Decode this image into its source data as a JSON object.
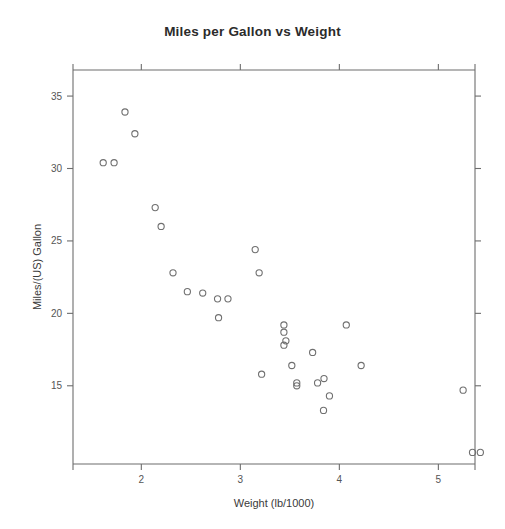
{
  "chart_data": {
    "type": "scatter",
    "title": "Miles per Gallon vs Weight",
    "xlabel": "Weight (lb/1000)",
    "ylabel": "Miles/(US) Gallon",
    "xlim": [
      1.31,
      5.37
    ],
    "ylim": [
      9.6,
      36.8
    ],
    "xticks": [
      2,
      3,
      4,
      5
    ],
    "xtick_labels": [
      "2",
      "3",
      "4",
      "5"
    ],
    "yticks": [
      15,
      20,
      25,
      30,
      35
    ],
    "ytick_labels": [
      "15",
      "20",
      "25",
      "30",
      "35"
    ],
    "grid": false,
    "legend": null,
    "marker": "open-circle",
    "marker_color": "#707070",
    "frame": "box-with-outward-ticks",
    "x": [
      1.615,
      1.725,
      1.835,
      1.935,
      2.14,
      2.2,
      2.32,
      2.465,
      2.62,
      2.77,
      2.78,
      2.875,
      3.15,
      3.19,
      3.215,
      3.44,
      3.44,
      3.44,
      3.46,
      3.52,
      3.57,
      3.57,
      3.73,
      3.78,
      3.84,
      3.845,
      3.9,
      4.07,
      4.22,
      5.25,
      5.345,
      5.424
    ],
    "y": [
      30.4,
      30.4,
      33.9,
      32.4,
      27.3,
      26.0,
      22.8,
      21.5,
      21.4,
      21.0,
      19.7,
      21.0,
      24.4,
      22.8,
      15.8,
      19.2,
      18.7,
      17.8,
      18.1,
      16.4,
      15.2,
      15.0,
      17.3,
      15.2,
      13.3,
      15.5,
      14.3,
      19.2,
      16.4,
      14.7,
      10.4,
      10.4
    ],
    "points": [
      {
        "x": 1.615,
        "y": 30.4
      },
      {
        "x": 1.725,
        "y": 30.4
      },
      {
        "x": 1.835,
        "y": 33.9
      },
      {
        "x": 1.935,
        "y": 32.4
      },
      {
        "x": 2.14,
        "y": 27.3
      },
      {
        "x": 2.2,
        "y": 26.0
      },
      {
        "x": 2.32,
        "y": 22.8
      },
      {
        "x": 2.465,
        "y": 21.5
      },
      {
        "x": 2.62,
        "y": 21.4
      },
      {
        "x": 2.77,
        "y": 21.0
      },
      {
        "x": 2.78,
        "y": 19.7
      },
      {
        "x": 2.875,
        "y": 21.0
      },
      {
        "x": 3.15,
        "y": 24.4
      },
      {
        "x": 3.19,
        "y": 22.8
      },
      {
        "x": 3.215,
        "y": 15.8
      },
      {
        "x": 3.44,
        "y": 19.2
      },
      {
        "x": 3.44,
        "y": 18.7
      },
      {
        "x": 3.44,
        "y": 17.8
      },
      {
        "x": 3.46,
        "y": 18.1
      },
      {
        "x": 3.52,
        "y": 16.4
      },
      {
        "x": 3.57,
        "y": 15.2
      },
      {
        "x": 3.57,
        "y": 15.0
      },
      {
        "x": 3.73,
        "y": 17.3
      },
      {
        "x": 3.78,
        "y": 15.2
      },
      {
        "x": 3.84,
        "y": 13.3
      },
      {
        "x": 3.845,
        "y": 15.5
      },
      {
        "x": 3.9,
        "y": 14.3
      },
      {
        "x": 4.07,
        "y": 19.2
      },
      {
        "x": 4.22,
        "y": 16.4
      },
      {
        "x": 5.25,
        "y": 14.7
      },
      {
        "x": 5.345,
        "y": 10.4
      },
      {
        "x": 5.424,
        "y": 10.4
      }
    ]
  }
}
